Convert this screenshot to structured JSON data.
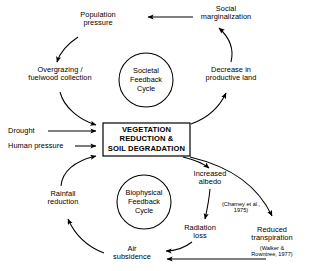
{
  "diagram": {
    "stroke_color": "#000000",
    "background_color": "#ffffff",
    "central_box": {
      "line1": "VEGETATION",
      "line2": "REDUCTION &",
      "line3": "SOIL DEGRADATION"
    },
    "circles": [
      {
        "line1": "Societal",
        "line2": "Feedback",
        "line3": "Cycle"
      },
      {
        "line1": "Biophysical",
        "line2": "Feedback",
        "line3": "Cycle"
      }
    ],
    "nodes": {
      "population_pressure": {
        "line1": "Population",
        "line2": "pressure"
      },
      "social_marginalization": {
        "line1": "Social",
        "line2": "marginalization"
      },
      "overgrazing": {
        "line1": "Overgrazing /",
        "line2": "fuelwood collection"
      },
      "decrease_productive_land": {
        "line1": "Decrease in",
        "line2": "productive land"
      },
      "drought": {
        "line1": "Drought"
      },
      "human_pressure": {
        "line1": "Human pressure"
      },
      "rainfall_reduction": {
        "line1": "Rainfall",
        "line2": "reduction"
      },
      "increased_albedo": {
        "line1": "Increased",
        "line2": "albedo"
      },
      "radiation_loss": {
        "line1": "Radiation",
        "line2": "loss"
      },
      "air_subsidence": {
        "line1": "Air",
        "line2": "subsidence"
      },
      "reduced_transpiration": {
        "line1": "Reduced",
        "line2": "transpiration"
      }
    },
    "citations": {
      "charney": {
        "line1": "(Charney et al.,",
        "line2": "1975)"
      },
      "walker": {
        "line1": "(Walker &",
        "line2": "Rowntree, 1977)"
      }
    }
  }
}
